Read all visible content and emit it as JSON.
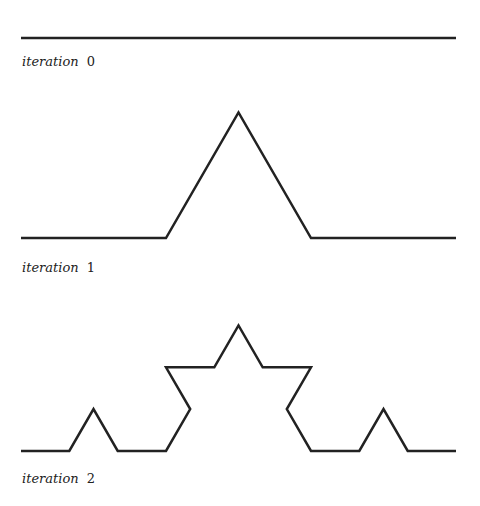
{
  "figure": {
    "stroke_color": "#222222",
    "stroke_width": 2.5,
    "x_start": 21,
    "x_end": 456,
    "panels": [
      {
        "iteration": 0,
        "baseline_y": 38,
        "label_word": "iteration",
        "label_num": "0",
        "label_top": 55
      },
      {
        "iteration": 1,
        "baseline_y": 238,
        "label_word": "iteration",
        "label_num": "1",
        "label_top": 261
      },
      {
        "iteration": 2,
        "baseline_y": 451,
        "label_word": "iteration",
        "label_num": "2",
        "label_top": 472
      }
    ]
  }
}
